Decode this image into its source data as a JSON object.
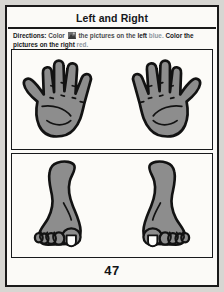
{
  "page": {
    "title": "Left and Right",
    "page_number": "47",
    "background_color": "#d7d6d2",
    "sheet_color": "#fbfaf7",
    "border_color": "#1a1a1a"
  },
  "directions": {
    "label": "Directions:",
    "text_1": "Color",
    "icon": "crayon-icon",
    "text_2": "the pictures on the",
    "word_left": "left",
    "word_blue": "blue.",
    "text_3": "Color the pictures on the",
    "word_right": "right",
    "word_red": "red."
  },
  "figures": {
    "fill_color": "#8d8d8d",
    "outline_color": "#121212",
    "nail_color": "#fdfdfb",
    "hands": [
      {
        "name": "left-hand",
        "side": "left",
        "thumb_side": "left"
      },
      {
        "name": "right-hand",
        "side": "right",
        "thumb_side": "right"
      }
    ],
    "feet": [
      {
        "name": "left-foot",
        "side": "left",
        "big_toe_side": "right"
      },
      {
        "name": "right-foot",
        "side": "right",
        "big_toe_side": "left"
      }
    ]
  }
}
